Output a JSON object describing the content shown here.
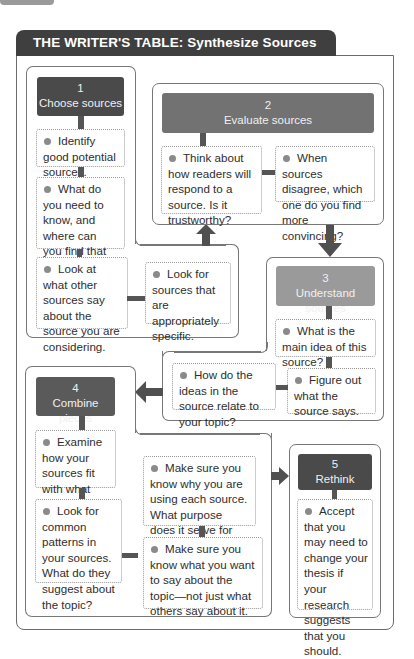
{
  "title": "THE WRITER'S TABLE: Synthesize Sources",
  "colors": {
    "header_bg": "#3f3f3f",
    "step1_bg": "#4a4a4a",
    "step2_bg": "#727272",
    "step3_bg": "#9a9a9a",
    "step4_bg": "#5a5a5a",
    "step5_bg": "#4a4a4a",
    "connector": "#555555",
    "bullet": "#8a8a8a"
  },
  "steps": [
    {
      "number": "1",
      "label": "Choose sources",
      "notes": [
        "Identify good potential sources.",
        "What do you need to know, and where can you find that information?",
        "Look at what other sources say about the source you are considering.",
        "Look for sources that are appropriately specific."
      ]
    },
    {
      "number": "2",
      "label": "Evaluate sources",
      "notes": [
        "Think about how readers will respond to a source. Is it trustworthy?",
        "When sources disagree, which one do you find more convincing?"
      ]
    },
    {
      "number": "3",
      "label": "Understand sources",
      "notes": [
        "What is the main idea of this source?",
        "Figure out what the source says.",
        "How do the ideas in the source relate to your topic?"
      ]
    },
    {
      "number": "4",
      "label": "Combine pieces",
      "notes": [
        "Examine how your sources fit with what your writing says.",
        "Look for common patterns in your sources. What do they suggest about the topic?",
        "Make sure you know why you are using each source. What purpose does it serve for your writing?",
        "Make sure you know what you want to say about the topic—not just what others say about it."
      ]
    },
    {
      "number": "5",
      "label": "Rethink",
      "notes": [
        "Accept that you may need to change your thesis if your research suggests that you should."
      ]
    }
  ],
  "arrows": [
    {
      "from": "1",
      "to": "2",
      "direction": "up"
    },
    {
      "from": "2",
      "to": "3",
      "direction": "down"
    },
    {
      "from": "3",
      "to": "4",
      "direction": "left"
    },
    {
      "from": "4",
      "to": "5",
      "direction": "right"
    }
  ]
}
